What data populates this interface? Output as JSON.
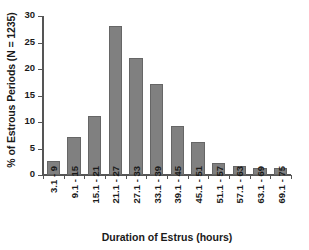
{
  "chart_data": {
    "type": "bar",
    "title": "",
    "xlabel": "Duration of Estrus (hours)",
    "ylabel": "% of Estrous Periods (N = 1235)",
    "categories": [
      "3.1 - 9",
      "9.1 - 15",
      "15.1 - 21",
      "21.1 - 27",
      "27.1 - 33",
      "33.1 - 39",
      "39.1 - 45",
      "45.1 - 51",
      "51.1 - 57",
      "57.1 - 63",
      "63.1 - 69",
      "69.1 - 75"
    ],
    "values": [
      2.5,
      7.0,
      11.0,
      28.1,
      22.0,
      17.1,
      9.2,
      6.2,
      2.2,
      1.7,
      1.2,
      1.2
    ],
    "ylim": [
      0,
      30
    ],
    "yticks": [
      0,
      5,
      10,
      15,
      20,
      25,
      30
    ],
    "ytick_labels": [
      "0",
      "5",
      "10",
      "15",
      "20",
      "25",
      "30"
    ],
    "grid": false,
    "legend": "none",
    "sample_size": 1235,
    "bar_color": "#808080",
    "bar_edge_color": "#666666",
    "axis_color": "#555555",
    "text_color": "#1a1a1a"
  }
}
